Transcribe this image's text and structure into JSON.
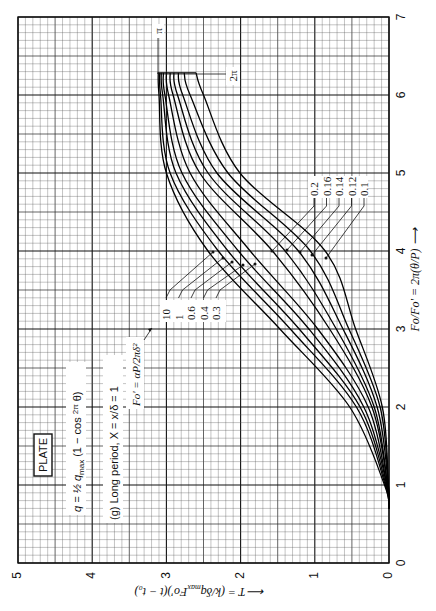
{
  "chart_data": {
    "type": "line",
    "orientation": "rotated-90-ccw",
    "title": "PLATE",
    "subtitle": "(g) Long period, X = x/δ = 1",
    "annotations": {
      "boundary_condition": "q = ½ q_max (1 − cos (2π/P) θ)",
      "parameter": "Fo' = αP/2πδ²",
      "end_markers": [
        "π",
        "2π"
      ]
    },
    "xlabel": "Fo/Fo' = 2π(θ/P) →",
    "ylabel": "T = (k/δq_max Fo')(t − t₀) →",
    "xlim": [
      0,
      7
    ],
    "ylim": [
      0,
      5
    ],
    "x_ticks": [
      "0",
      "1",
      "2",
      "3",
      "4",
      "5",
      "6",
      "7"
    ],
    "y_ticks": [
      "0",
      "1",
      "2",
      "3",
      "4",
      "5"
    ],
    "grid": true,
    "legend_groups": [
      {
        "labels": [
          "10",
          "1",
          "0.6",
          "0.4",
          "0.3"
        ]
      },
      {
        "labels": [
          "0.2",
          "0.16",
          "0.14",
          "0.12",
          "0.1"
        ]
      }
    ],
    "x": [
      0.7,
      1,
      2,
      3,
      4,
      5,
      6,
      6.283
    ],
    "series": [
      {
        "name": "Fo' = 10",
        "values": [
          0,
          0.06,
          0.53,
          1.47,
          2.44,
          3.0,
          3.1,
          3.11
        ]
      },
      {
        "name": "Fo' = 1",
        "values": [
          0,
          0.05,
          0.44,
          1.33,
          2.3,
          2.95,
          3.08,
          3.09
        ]
      },
      {
        "name": "Fo' = 0.6",
        "values": [
          0,
          0.04,
          0.39,
          1.21,
          2.17,
          2.87,
          3.05,
          3.07
        ]
      },
      {
        "name": "Fo' = 0.4",
        "values": [
          0,
          0.03,
          0.34,
          1.08,
          2.03,
          2.79,
          3.02,
          3.04
        ]
      },
      {
        "name": "Fo' = 0.3",
        "values": [
          0,
          0.03,
          0.28,
          0.96,
          1.87,
          2.68,
          2.97,
          3.0
        ]
      },
      {
        "name": "Fo' = 0.2",
        "values": [
          0,
          0.02,
          0.23,
          0.8,
          1.57,
          2.55,
          2.91,
          2.95
        ]
      },
      {
        "name": "Fo' = 0.16",
        "values": [
          0,
          0.02,
          0.2,
          0.71,
          1.4,
          2.44,
          2.85,
          2.9
        ]
      },
      {
        "name": "Fo' = 0.14",
        "values": [
          0,
          0.01,
          0.16,
          0.62,
          1.22,
          2.32,
          2.78,
          2.84
        ]
      },
      {
        "name": "Fo' = 0.12",
        "values": [
          0,
          0.01,
          0.12,
          0.54,
          1.06,
          2.17,
          2.68,
          2.76
        ]
      },
      {
        "name": "Fo' = 0.1",
        "values": [
          0,
          0.01,
          0.09,
          0.45,
          0.86,
          2.01,
          2.5,
          2.6
        ]
      }
    ]
  },
  "labels": {
    "plate": "PLATE",
    "formula": "q = ½ q",
    "formula_sub": "max",
    "formula_rest": " (1 − cos ",
    "formula_frac_num": "2π",
    "formula_frac_den": "P",
    "formula_end": " θ)",
    "case": "(g) Long period, X = x/δ = 1",
    "param": "Fo' = αP/2πδ²",
    "pi": "π",
    "two_pi": "2π",
    "xlabel": "Fo/Fo' = 2π(θ/P) ⟶",
    "ylabel": "⟵ T = (k/δq",
    "ylabel_sub": "max",
    "ylabel_rest": "Fo')(t − t₀)",
    "group_a": [
      "10",
      "1",
      "0.6",
      "0.4",
      "0.3"
    ],
    "group_b": [
      "0.2",
      "0.16",
      "0.14",
      "0.12",
      "0.1"
    ],
    "x_ticks": [
      "0",
      "1",
      "2",
      "3",
      "4",
      "5",
      "6",
      "7"
    ],
    "y_ticks": [
      "0",
      "1",
      "2",
      "3",
      "4",
      "5"
    ]
  }
}
